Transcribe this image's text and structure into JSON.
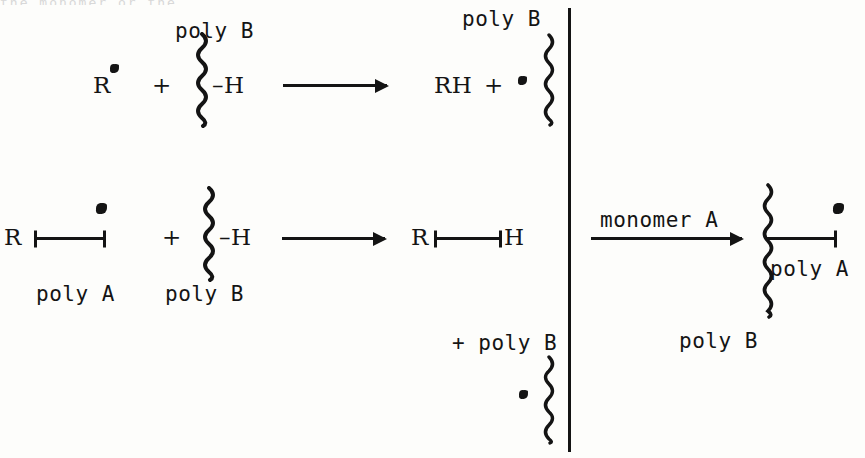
{
  "figure": {
    "kind": "chemical-reaction-scheme",
    "topic": "free-radical grafting of monomer A onto poly B",
    "ink_color": "#141414",
    "background_color": "#fdfdfb",
    "ghost_text": "the monomer or the"
  },
  "reaction_1": {
    "reactant_radical": "R",
    "plus_1": "+",
    "chain_label": "poly B",
    "chain_substituent": "–H",
    "arrow": "→",
    "product": "RH",
    "plus_2": "+",
    "product_chain_label": "poly B"
  },
  "reaction_2": {
    "reactant_prefix": "R",
    "reactant_chain_label": "poly A",
    "plus_1": "+",
    "chain_label": "poly B",
    "chain_substituent": "–H",
    "arrow": "→",
    "product_prefix": "R",
    "product_suffix": "H",
    "plus_2": "+ poly B"
  },
  "reaction_3": {
    "arrow_label": "monomer A",
    "arrow": "→",
    "branch_label": "poly A",
    "backbone_label": "poly B"
  }
}
